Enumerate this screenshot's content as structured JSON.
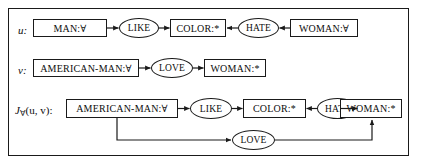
{
  "figure": {
    "border_color": "#1a1a1a",
    "background": "#ffffff",
    "text_color": "#0d0d0d"
  },
  "rows": [
    {
      "id": "row-u",
      "label": "u:",
      "label_base": "u",
      "label_sub": "",
      "label_tail": ":",
      "nodes": [
        {
          "kind": "box",
          "name": "concept-man",
          "text": "MAN:∀"
        },
        {
          "kind": "ellipse",
          "name": "relation-like",
          "text": "LIKE"
        },
        {
          "kind": "box",
          "name": "concept-color",
          "text": "COLOR:*"
        },
        {
          "kind": "ellipse",
          "name": "relation-hate",
          "text": "HATE"
        },
        {
          "kind": "box",
          "name": "concept-woman",
          "text": "WOMAN:∀"
        }
      ],
      "arrows": [
        "right",
        "right",
        "left",
        "left"
      ]
    },
    {
      "id": "row-v",
      "label": "v:",
      "label_base": "v",
      "label_sub": "",
      "label_tail": ":",
      "nodes": [
        {
          "kind": "box",
          "name": "concept-american-man",
          "text": "AMERICAN-MAN:∀"
        },
        {
          "kind": "ellipse",
          "name": "relation-love",
          "text": "LOVE"
        },
        {
          "kind": "box",
          "name": "concept-woman",
          "text": "WOMAN:*"
        }
      ],
      "arrows": [
        "right",
        "right"
      ]
    },
    {
      "id": "row-join",
      "label": "J∀(u, v):",
      "label_base": "J",
      "label_sub": "∀",
      "label_tail": "(u, v):",
      "nodes": [
        {
          "kind": "box",
          "name": "concept-american-man",
          "text": "AMERICAN-MAN:∀"
        },
        {
          "kind": "ellipse",
          "name": "relation-like",
          "text": "LIKE"
        },
        {
          "kind": "box",
          "name": "concept-color",
          "text": "COLOR:*"
        },
        {
          "kind": "ellipse",
          "name": "relation-hate",
          "text": "HATE"
        },
        {
          "kind": "box",
          "name": "concept-woman",
          "text": "WOMAN:*"
        }
      ],
      "arrows": [
        "right",
        "right",
        "left",
        "left"
      ],
      "loop": {
        "name": "relation-love-loop",
        "text": "LOVE",
        "from": "concept-american-man",
        "to": "concept-woman"
      }
    }
  ]
}
